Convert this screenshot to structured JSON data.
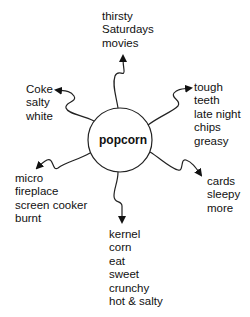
{
  "diagram": {
    "type": "semantic web / word map",
    "center": "popcorn",
    "branches": [
      {
        "id": "top",
        "words": [
          "thirsty",
          "Saturdays",
          "movies"
        ]
      },
      {
        "id": "upper-left",
        "words": [
          "Coke",
          "salty",
          "white"
        ]
      },
      {
        "id": "upper-right",
        "words": [
          "tough",
          "teeth",
          "late night",
          "chips",
          "greasy"
        ]
      },
      {
        "id": "lower-left",
        "words": [
          "micro",
          "fireplace",
          "screen cooker",
          "burnt"
        ]
      },
      {
        "id": "bottom",
        "words": [
          "kernel",
          "corn",
          "eat",
          "sweet",
          "crunchy",
          "hot & salty"
        ]
      },
      {
        "id": "lower-right",
        "words": [
          "cards",
          "sleepy",
          "more"
        ]
      }
    ]
  }
}
